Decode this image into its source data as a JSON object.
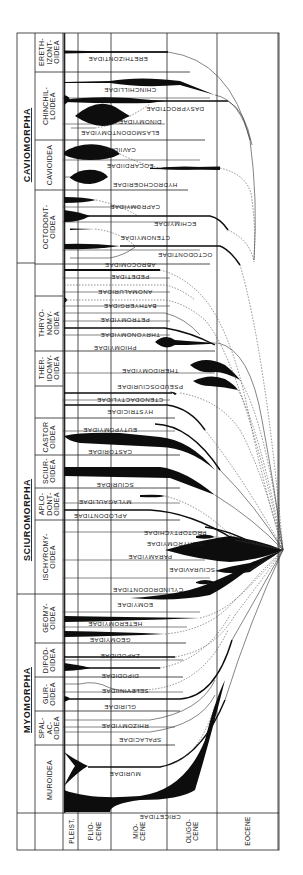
{
  "suborders": [
    {
      "label": "CAVIOMORPHA"
    },
    {
      "label": "SCIUROMORPHA"
    },
    {
      "label": "MYOMORPHA"
    }
  ],
  "superfamilies": [
    {
      "label": [
        "ERETH-",
        "IZONT-",
        "OIDEA"
      ]
    },
    {
      "label": [
        "CHINCHIL-",
        "LOIDEA"
      ]
    },
    {
      "label": [
        "CAVIOIDEA"
      ]
    },
    {
      "label": [
        "OCTODONT-",
        "OIDEA"
      ]
    },
    {
      "label": [
        "THRYO-",
        "NOMY-",
        "OIDEA"
      ]
    },
    {
      "label": [
        "THER-",
        "IDOMY-",
        "OIDEA"
      ]
    },
    {
      "label": [
        "CASTOR",
        "OIDEA"
      ]
    },
    {
      "label": [
        "SCIUR-",
        "OIDEA"
      ]
    },
    {
      "label": [
        "APLO-",
        "DONT-",
        "OIDEA"
      ]
    },
    {
      "label": [
        "ISCHYROMY-",
        "OIDEA"
      ]
    },
    {
      "label": [
        "GEOMY-",
        "OIDEA"
      ]
    },
    {
      "label": [
        "DIPOD-",
        "OIDEA"
      ]
    },
    {
      "label": [
        "GLIR-",
        "OIDEA"
      ]
    },
    {
      "label": [
        "SPAL-",
        "AC-",
        "OIDEA"
      ]
    },
    {
      "label": [
        "MUROIDEA"
      ]
    }
  ],
  "families": [
    "ERETHIZONTIDAE",
    "CHINCHILLIDAE",
    "DASYPROCTIDAE",
    "DINOMYIDAE",
    "ELASMODONTOMYIDAE",
    "CAVIIDAE",
    "EOCARDIIDAE",
    "HYDROCHOERIDAE",
    "CAPROMYIDAE",
    "ECHIMYIDAE",
    "CTENOMYIDAE",
    "OCTODONTIDAE",
    "ABROCOMIDAE",
    "PEDETIDAE",
    "ANOMALURIDAE",
    "BATHYERGIDAE",
    "PETROMYIDAE",
    "THRYONOMYIDAE",
    "PHIOMYIDAE",
    "THERIDOMYIDAE",
    "PSEUDOSCIURIDAE",
    "CTENODACTYLIDAE",
    "HYSTRICIDAE",
    "EUTYPOMYIDAE",
    "CASTORIDAE",
    "SCIURIDAE",
    "MYLAGAULIDAE",
    "APLODONTIDAE",
    "PROTOPTYCHIDAE",
    "ISCHYROMYIDAE",
    "PARAMYIDAE",
    "SCIURAVIDAE",
    "CYLINDRODONTIDAE",
    "EOMYIDAE",
    "HETEROMYIDAE",
    "GEOMYIDAE",
    "ZAPODIDAE",
    "DIPODIDAE",
    "SELEVINIIDAE",
    "GLIRIDAE",
    "RHIZOMYIDAE",
    "SPALACIDAE",
    "MURIDAE",
    "CRICETIDAE"
  ],
  "epochs": [
    {
      "label": [
        "PLEIST."
      ]
    },
    {
      "label": [
        "PLIO-",
        "CENE"
      ]
    },
    {
      "label": [
        "MIO-",
        "CENE"
      ]
    },
    {
      "label": [
        "OLIGO-",
        "CENE"
      ]
    },
    {
      "label": [
        "EOCENE"
      ]
    }
  ]
}
